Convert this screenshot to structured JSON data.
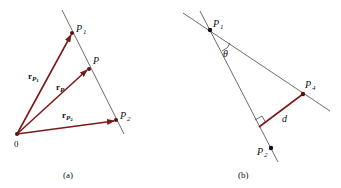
{
  "figure_a": {
    "caption": "(a)",
    "origin_label": "0",
    "points": {
      "p1": {
        "label": "P",
        "sub": "1"
      },
      "p": {
        "label": "P",
        "sub": ""
      },
      "p2": {
        "label": "P",
        "sub": "2"
      }
    },
    "vectors": {
      "r_p1": {
        "label": "r",
        "sub": "P",
        "subsub": "1"
      },
      "r_p": {
        "label": "r",
        "sub": "P",
        "subsub": ""
      },
      "r_p2": {
        "label": "r",
        "sub": "P",
        "subsub": "2"
      }
    }
  },
  "figure_b": {
    "caption": "(b)",
    "points": {
      "p1": {
        "label": "P",
        "sub": "1"
      },
      "p4": {
        "label": "P",
        "sub": "4"
      },
      "p2": {
        "label": "P",
        "sub": "2"
      }
    },
    "angle_label": "θ",
    "distance_label": "d"
  },
  "colors": {
    "vector": "#7a1a1a",
    "line": "#444444",
    "point": "#111111"
  }
}
